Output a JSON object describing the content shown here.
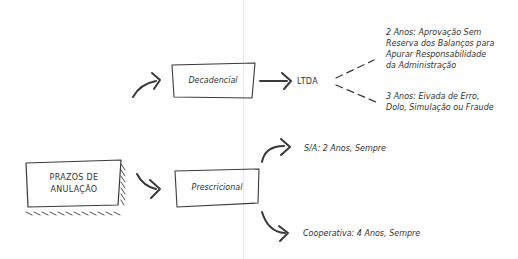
{
  "diagram": {
    "root": {
      "line1": "PRAZOS DE",
      "line2": "ANULAÇÃO"
    },
    "branches": [
      {
        "label": "Decadencial",
        "target": "LTDA",
        "subitems": [
          {
            "lines": [
              "2 Anos: Aprovação Sem",
              "Reserva dos Balanços para",
              "Apurar Responsabilidade",
              "da Administração"
            ]
          },
          {
            "lines": [
              "3 Anos: Eivada de Erro,",
              "Dolo, Simulação ou Fraude"
            ]
          }
        ]
      },
      {
        "label": "Prescricional",
        "subitems": [
          {
            "text": "S/A: 2 Anos, Sempre"
          },
          {
            "text": "Cooperativa: 4 Anos, Sempre"
          }
        ]
      }
    ],
    "colors": {
      "stroke": "#3a3a3a",
      "background": "#ffffff",
      "fold": "#e8e8e8"
    }
  }
}
